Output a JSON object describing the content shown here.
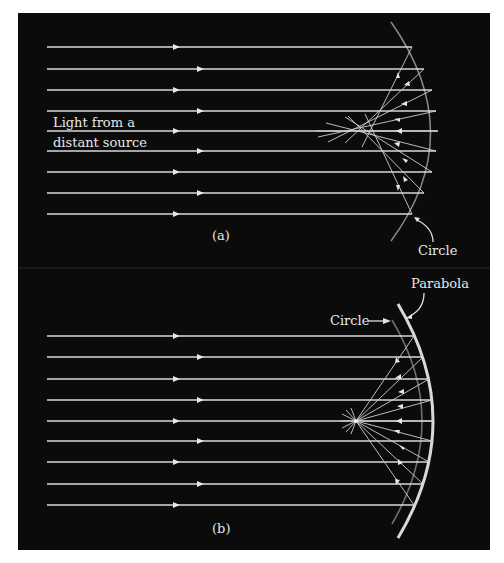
{
  "figure": {
    "background": "#0b0b0b",
    "ray_color": "#d8d8d8",
    "panel_a": {
      "caption": "(a)",
      "source_label_line1": "Light from a",
      "source_label_line2": "distant source",
      "mirror_label": "Circle",
      "mirror_type": "spherical (circle)",
      "focus": "spread (spherical aberration)"
    },
    "panel_b": {
      "caption": "(b)",
      "mirror_label_outer": "Parabola",
      "mirror_label_inner": "Circle",
      "mirror_type": "parabolic vs circle",
      "focus": "single point"
    }
  }
}
